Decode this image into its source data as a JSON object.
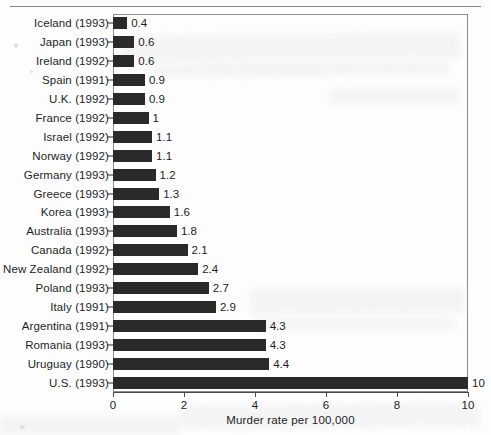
{
  "chart_data": {
    "type": "bar",
    "orientation": "horizontal",
    "title": "",
    "xlabel": "Murder rate per 100,000",
    "ylabel": "",
    "xlim": [
      0,
      10
    ],
    "xticks": [
      0,
      2,
      4,
      6,
      8,
      10
    ],
    "xtick_labels": [
      "0",
      "2",
      "4",
      "6",
      "8",
      "10"
    ],
    "grid": false,
    "legend": null,
    "bar_color": "#2a2a2a",
    "frame_color": "#8c8c8c",
    "categories": [
      "Iceland (1993)",
      "Japan (1993)",
      "Ireland (1992)",
      "Spain (1991)",
      "U.K. (1992)",
      "France (1992)",
      "Israel (1992)",
      "Norway (1992)",
      "Germany (1993)",
      "Greece (1993)",
      "Korea (1993)",
      "Australia (1993)",
      "Canada (1992)",
      "New Zealand (1992)",
      "Poland (1993)",
      "Italy (1991)",
      "Argentina (1991)",
      "Romania (1993)",
      "Uruguay (1990)",
      "U.S. (1993)"
    ],
    "values": [
      0.4,
      0.6,
      0.6,
      0.9,
      0.9,
      1,
      1.1,
      1.1,
      1.2,
      1.3,
      1.6,
      1.8,
      2.1,
      2.4,
      2.7,
      2.9,
      4.3,
      4.3,
      4.4,
      10
    ],
    "value_labels": [
      "0.4",
      "0.6",
      "0.6",
      "0.9",
      "0.9",
      "1",
      "1.1",
      "1.1",
      "1.2",
      "1.3",
      "1.6",
      "1.8",
      "2.1",
      "2.4",
      "2.7",
      "2.9",
      "4.3",
      "4.3",
      "4.4",
      "10"
    ]
  }
}
